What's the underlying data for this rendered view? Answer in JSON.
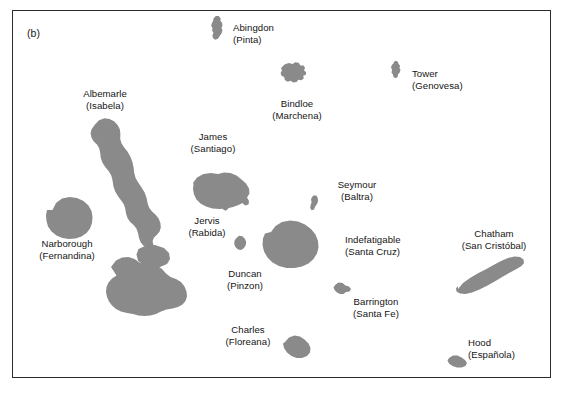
{
  "figure": {
    "panel_letter": "(b)",
    "border_color": "#2b2b2b",
    "background_color": "#ffffff",
    "island_fill_color": "#8a8a8a",
    "text_color": "#151515"
  },
  "map": {
    "region": "Galapagos Islands",
    "islands": [
      {
        "id": "abingdon",
        "english_name": "Abingdon",
        "spanish_name": "(Pinta)",
        "label_x": 233,
        "label_y": 22,
        "align": "left"
      },
      {
        "id": "bindloe",
        "english_name": "Bindloe",
        "spanish_name": "(Marchena)",
        "label_x": 297,
        "label_y": 98,
        "align": "center"
      },
      {
        "id": "tower",
        "english_name": "Tower",
        "spanish_name": "(Genovesa)",
        "label_x": 412,
        "label_y": 68,
        "align": "left"
      },
      {
        "id": "albemarle",
        "english_name": "Albemarle",
        "spanish_name": "(Isabela)",
        "label_x": 105,
        "label_y": 88,
        "align": "center"
      },
      {
        "id": "james",
        "english_name": "James",
        "spanish_name": "(Santiago)",
        "label_x": 213,
        "label_y": 131,
        "align": "center"
      },
      {
        "id": "seymour",
        "english_name": "Seymour",
        "spanish_name": "(Baltra)",
        "label_x": 357,
        "label_y": 179,
        "align": "center"
      },
      {
        "id": "jervis",
        "english_name": "Jervis",
        "spanish_name": "(Rabida)",
        "label_x": 207,
        "label_y": 215,
        "align": "center"
      },
      {
        "id": "narborough",
        "english_name": "Narborough",
        "spanish_name": "(Fernandina)",
        "label_x": 67,
        "label_y": 238,
        "align": "center"
      },
      {
        "id": "indefatigable",
        "english_name": "Indefatigable",
        "spanish_name": "(Santa Cruz)",
        "label_x": 345,
        "label_y": 234,
        "align": "left"
      },
      {
        "id": "chatham",
        "english_name": "Chatham",
        "spanish_name": "(San Cristóbal)",
        "label_x": 494,
        "label_y": 228,
        "align": "center"
      },
      {
        "id": "duncan",
        "english_name": "Duncan",
        "spanish_name": "(Pinzon)",
        "label_x": 245,
        "label_y": 268,
        "align": "center"
      },
      {
        "id": "barrington",
        "english_name": "Barrington",
        "spanish_name": "(Santa Fe)",
        "label_x": 376,
        "label_y": 296,
        "align": "center"
      },
      {
        "id": "charles",
        "english_name": "Charles",
        "spanish_name": "(Floreana)",
        "label_x": 248,
        "label_y": 324,
        "align": "center"
      },
      {
        "id": "hood",
        "english_name": "Hood",
        "spanish_name": "(Española)",
        "label_x": 468,
        "label_y": 337,
        "align": "left"
      }
    ]
  }
}
